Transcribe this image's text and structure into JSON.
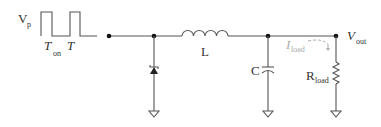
{
  "diagram": {
    "type": "circuit-schematic",
    "colors": {
      "wire": "#555555",
      "node": "#111111",
      "label": "#333333",
      "current_annotation": "#aaaaaa"
    },
    "source": {
      "label_main": "V",
      "label_sub": "p",
      "waveform": "pulse-train",
      "t_on_main": "T",
      "t_on_sub": "on",
      "period_label": "T"
    },
    "components": {
      "diode": {
        "label": "",
        "kind": "schottky-diode"
      },
      "inductor": {
        "label": "L"
      },
      "capacitor": {
        "label": "C"
      },
      "resistor": {
        "label_main": "R",
        "label_sub": "load"
      }
    },
    "output": {
      "label_main": "V",
      "label_sub": "out"
    },
    "current": {
      "label_main": "I",
      "label_sub": "load"
    }
  }
}
